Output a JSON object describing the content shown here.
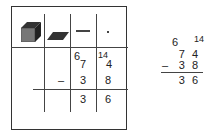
{
  "chart": {
    "headers": [
      "hundreds-block",
      "tens-flat",
      "ones-rod",
      "unit-dot"
    ],
    "ones_symbol": "—",
    "dot_symbol": "·",
    "row_regroup": {
      "tens_crossed": "6",
      "tens_original": "7",
      "ones_regrouped": "14",
      "ones_original": "4"
    },
    "row_subtract": {
      "operator": "–",
      "tens": "3",
      "ones": "8"
    },
    "row_result": {
      "tens": "3",
      "ones": "6"
    }
  },
  "side": {
    "regroup_tens": "6",
    "regroup_ones": "14",
    "line1": "7 4",
    "operator": "–",
    "line2": "3 8",
    "result": "3 6"
  }
}
